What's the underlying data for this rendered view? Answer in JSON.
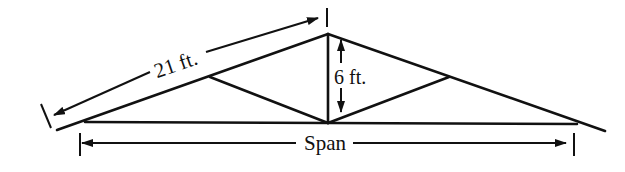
{
  "diagram": {
    "type": "roof-truss",
    "stroke_color": "#111111",
    "background": "#ffffff",
    "labels": {
      "rafter_length": "21 ft.",
      "rise": "6 ft.",
      "span": "Span"
    },
    "dimensions": {
      "rafter_length_ft": 21,
      "rise_ft": 6,
      "span": "unknown"
    }
  }
}
